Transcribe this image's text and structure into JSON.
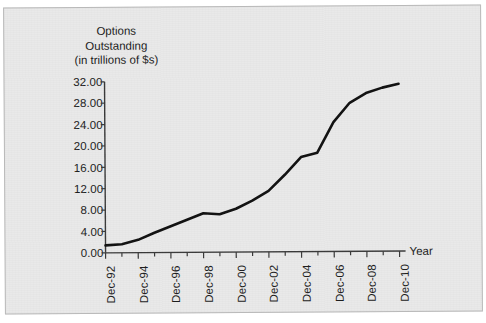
{
  "figure": {
    "title_lines": [
      "Options",
      "Outstanding",
      "(in trillions of $s)"
    ],
    "x_axis_title": "Year",
    "paper_color": "#e9e9e9",
    "line_color": "#111111",
    "axis_color": "#3a3a3a"
  },
  "chart_data": {
    "type": "line",
    "title": "Options Outstanding (in trillions of $s)",
    "xlabel": "Year",
    "ylabel": "Options Outstanding (in trillions of $s)",
    "ylim": [
      0.0,
      32.0
    ],
    "ytick_labels": [
      "32.00",
      "28.00",
      "24.00",
      "20.00",
      "16.00",
      "12.00",
      "8.00",
      "4.00",
      "0.00"
    ],
    "ytick_values": [
      32.0,
      28.0,
      24.0,
      20.0,
      16.0,
      12.0,
      8.0,
      4.0,
      0.0
    ],
    "xtick_labels": [
      "Dec-92",
      "Dec-94",
      "Dec-96",
      "Dec-98",
      "Dec-00",
      "Dec-02",
      "Dec-04",
      "Dec-06",
      "Dec-08",
      "Dec-10"
    ],
    "xtick_values": [
      1992,
      1994,
      1996,
      1998,
      2000,
      2002,
      2004,
      2006,
      2008,
      2010
    ],
    "minor_xticks_every_years": 1,
    "grid": false,
    "legend": null,
    "x": [
      1992,
      1993,
      1994,
      1995,
      1996,
      1997,
      1998,
      1999,
      2000,
      2001,
      2002,
      2003,
      2004,
      2005,
      2006,
      2007,
      2008,
      2009,
      2010
    ],
    "series": [
      {
        "name": "Options Outstanding",
        "values": [
          1.4,
          1.6,
          2.4,
          3.7,
          4.9,
          6.1,
          7.3,
          7.1,
          8.1,
          9.6,
          11.4,
          14.4,
          17.7,
          18.5,
          24.2,
          27.8,
          29.6,
          30.6,
          31.3
        ]
      }
    ]
  }
}
